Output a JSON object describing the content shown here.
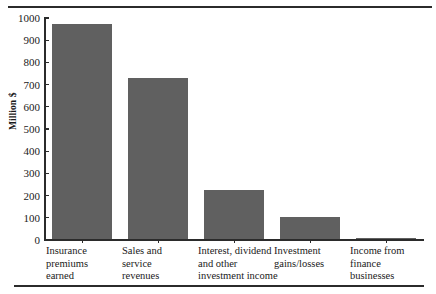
{
  "figure": {
    "top_rule": "horizontal-rule",
    "bottom_rule": "horizontal-rule"
  },
  "chart_data": {
    "type": "bar",
    "title": "",
    "xlabel": "",
    "ylabel": "Million $",
    "ylim": [
      0,
      1000
    ],
    "grid": false,
    "legend": "none",
    "categories": [
      "Insurance premiums earned",
      "Sales and service revenues",
      "Interest, dividend and other investment income",
      "Investment gains/losses",
      "Income from finance businesses"
    ],
    "category_lines": [
      [
        "Insurance",
        "premiums",
        "earned"
      ],
      [
        "Sales and",
        "service",
        "revenues"
      ],
      [
        "Interest, dividend",
        "and other",
        "investment income"
      ],
      [
        "Investment",
        "gains/losses"
      ],
      [
        "Income from",
        "finance",
        "businesses"
      ]
    ],
    "values": [
      970,
      725,
      220,
      100,
      5
    ],
    "ytick_labels": [
      "1000",
      "900",
      "800",
      "700",
      "600",
      "500",
      "400",
      "300",
      "200",
      "100",
      "0"
    ],
    "ytick_values": [
      1000,
      900,
      800,
      700,
      600,
      500,
      400,
      300,
      200,
      100,
      0
    ],
    "bar_color": "#606060",
    "axis_color": "#2b2b2b"
  }
}
